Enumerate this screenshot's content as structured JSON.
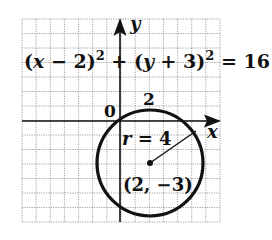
{
  "figure": {
    "equation": {
      "part1": "(",
      "x": "x",
      "part2": " − 2)",
      "sup1": "2",
      "part3": " + (",
      "y": "y",
      "part4": " + 3)",
      "sup2": "2",
      "part5": " = 16"
    },
    "axis_labels": {
      "x": "x",
      "y": "y"
    },
    "tick_labels": {
      "origin": "0",
      "x_tick": "2"
    },
    "radius_label": {
      "r": "r",
      "rest": " = 4"
    },
    "center_label": "(2, −3)",
    "colors": {
      "ink": "#111111",
      "grid": "#8a8a8a",
      "background": "#ffffff"
    }
  },
  "chart_data": {
    "type": "diagram",
    "shape": "circle",
    "center": [
      2,
      -3
    ],
    "radius": 4,
    "xlabel": "x",
    "ylabel": "y",
    "xlim": [
      -7,
      7
    ],
    "ylim": [
      -7,
      7
    ],
    "grid": true,
    "grid_step": 1,
    "annotations": [
      "0",
      "2",
      "r = 4",
      "(2, −3)"
    ]
  }
}
